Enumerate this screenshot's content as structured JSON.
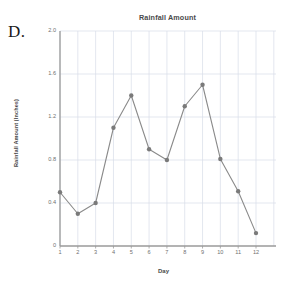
{
  "panel": {
    "label": "D."
  },
  "chart_data": {
    "type": "line",
    "title": "Rainfall Amount",
    "xlabel": "Day",
    "ylabel": "Rainfall Amount (Inches)",
    "categories": [
      "1",
      "2",
      "3",
      "4",
      "5",
      "6",
      "7",
      "8",
      "9",
      "10",
      "11",
      "12"
    ],
    "x": [
      1,
      2,
      3,
      4,
      5,
      6,
      7,
      8,
      9,
      10,
      11,
      12
    ],
    "values": [
      0.5,
      0.3,
      0.4,
      1.1,
      1.4,
      0.9,
      0.8,
      1.3,
      1.5,
      0.81,
      0.51,
      0.12
    ],
    "series": [
      {
        "name": "Rainfall Amount",
        "values": [
          0.5,
          0.3,
          0.4,
          1.1,
          1.4,
          0.9,
          0.8,
          1.3,
          1.5,
          0.81,
          0.51,
          0.12
        ]
      }
    ],
    "ylim": [
      0,
      2.0
    ],
    "xlim": [
      1,
      12
    ],
    "yticks": [
      "0",
      "0.4",
      "0.8",
      "1.2",
      "1.6",
      "2.0"
    ],
    "ytick_values": [
      0,
      0.4,
      0.8,
      1.2,
      1.6,
      2.0
    ],
    "xticks": [
      "1",
      "2",
      "3",
      "4",
      "5",
      "6",
      "7",
      "8",
      "9",
      "10",
      "11",
      "12"
    ],
    "grid": true,
    "legend": null,
    "line_color": "#8a8a8a",
    "marker_color": "#7a7a7a",
    "grid_color": "#d7dce8",
    "axis_color": "#9a9a9a"
  }
}
